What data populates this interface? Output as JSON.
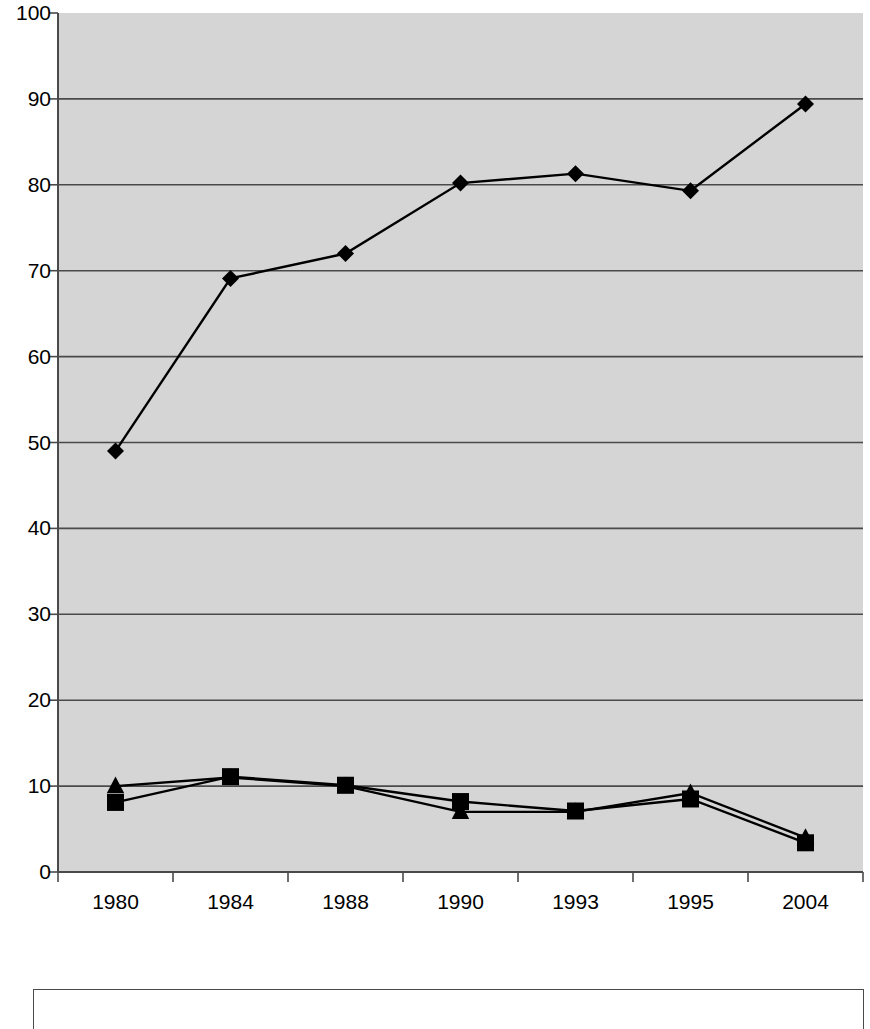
{
  "chart_data": {
    "type": "line",
    "title": "",
    "subtitle": "",
    "xlabel": "",
    "ylabel": "",
    "categories": [
      "1980",
      "1984",
      "1988",
      "1990",
      "1993",
      "1995",
      "2004"
    ],
    "ylim": [
      0,
      100
    ],
    "yticks": [
      0,
      10,
      20,
      30,
      40,
      50,
      60,
      70,
      80,
      90,
      100
    ],
    "ytick_labels": [
      "0",
      "10",
      "20",
      "30",
      "40",
      "50",
      "60",
      "70",
      "80",
      "90",
      "100"
    ],
    "grid": true,
    "grid_axis": "y",
    "legend_position": "bottom",
    "legend_entries": [],
    "plot_background": "#d5d5d5",
    "line_color": "#000000",
    "series": [
      {
        "name": "series-1",
        "marker": "diamond",
        "color": "#000000",
        "values": [
          49.0,
          69.1,
          72.0,
          80.2,
          81.3,
          79.3,
          89.4
        ]
      },
      {
        "name": "series-2",
        "marker": "square",
        "color": "#000000",
        "values": [
          8.1,
          11.1,
          10.1,
          8.2,
          7.1,
          8.5,
          3.4
        ]
      },
      {
        "name": "series-3",
        "marker": "triangle",
        "color": "#000000",
        "values": [
          10.0,
          11.0,
          10.0,
          7.0,
          7.0,
          9.2,
          4.0
        ]
      }
    ]
  },
  "legend": {
    "visible": true,
    "clipped": true,
    "border_color": "#4a4a4a",
    "background": "#ffffff"
  }
}
